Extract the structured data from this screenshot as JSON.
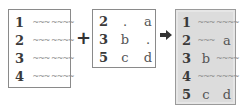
{
  "left_table": {
    "rows": [
      {
        "key": "1",
        "a": "~~~",
        "b": "~~~~"
      },
      {
        "key": "2",
        "a": "~~~",
        "b": "~~~~"
      },
      {
        "key": "3",
        "a": "~~~",
        "b": "~~~~"
      },
      {
        "key": "4",
        "a": "~~~",
        "b": "~~~~"
      }
    ]
  },
  "operator_plus": "+",
  "mid_table": {
    "rows": [
      {
        "key": "2",
        "a": ".",
        "b": "a"
      },
      {
        "key": "3",
        "a": "b",
        "b": "."
      },
      {
        "key": "5",
        "a": "c",
        "b": "d"
      }
    ]
  },
  "operator_arrow": "arrow-right-icon",
  "result_table": {
    "rows": [
      {
        "key": "1",
        "a": "~~~",
        "b": "~~~~"
      },
      {
        "key": "2",
        "a": "~~~",
        "b": "a"
      },
      {
        "key": "3",
        "a": "b",
        "b": "~~~~"
      },
      {
        "key": "4",
        "a": "~~~",
        "b": "~~~~"
      },
      {
        "key": "5",
        "a": "c",
        "b": "d"
      }
    ]
  },
  "colors": {
    "result_bg": "#dcdcdc",
    "border": "#8a8a8a",
    "text": "#3a3a3a",
    "scribble": "#8a8a8a"
  }
}
